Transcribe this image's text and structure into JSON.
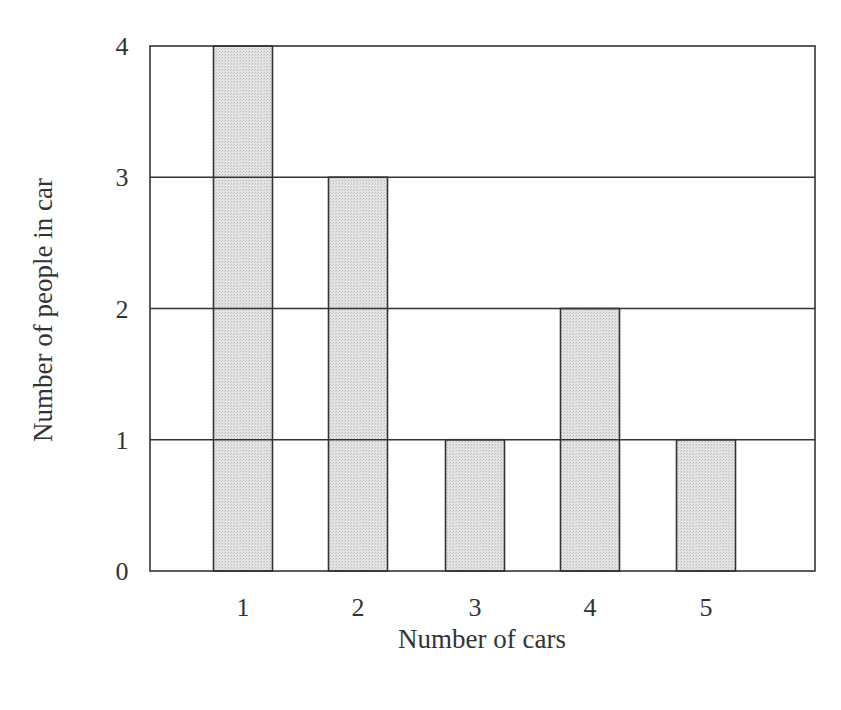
{
  "chart_data": {
    "type": "bar",
    "title": "",
    "xlabel": "Number of cars",
    "ylabel": "Number of people in car",
    "categories": [
      "1",
      "2",
      "3",
      "4",
      "5"
    ],
    "values": [
      4,
      3,
      1,
      2,
      1
    ],
    "yticks": [
      "0",
      "1",
      "2",
      "3",
      "4"
    ],
    "ylim": [
      0,
      4
    ],
    "grid": "horizontal",
    "legend": null,
    "colors": {
      "bar_fill": "#d9d9d9",
      "bar_stroke": "#333333",
      "grid": "#333333",
      "background": "#ffffff"
    }
  }
}
